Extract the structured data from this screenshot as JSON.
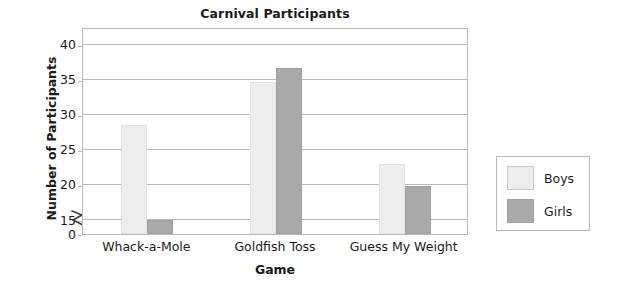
{
  "chart_data": {
    "type": "bar",
    "title": "Carnival Participants",
    "xlabel": "Game",
    "ylabel": "Number of Participants",
    "categories": [
      "Whack-a-Mole",
      "Goldfish Toss",
      "Guess My Weight"
    ],
    "series": [
      {
        "name": "Boys",
        "color": "#ededed",
        "values": [
          28.5,
          34.6,
          23.0
        ]
      },
      {
        "name": "Girls",
        "color": "#a9a9a9",
        "values": [
          14.5,
          36.7,
          19.8
        ]
      }
    ],
    "ylim": [
      0,
      42.5
    ],
    "yticks": [
      0,
      15,
      20,
      25,
      30,
      35,
      40
    ],
    "ytick_labels": [
      "0",
      "15",
      "20",
      "25",
      "30",
      "35",
      "40"
    ],
    "axis_break": {
      "present": true,
      "between": [
        0,
        15
      ],
      "symbol": "zigzag"
    },
    "grid": true,
    "gridlines_at": [
      15,
      20,
      25,
      30,
      35,
      40
    ],
    "legend": {
      "position": "right-outside",
      "entries": [
        "Boys",
        "Girls"
      ]
    }
  }
}
